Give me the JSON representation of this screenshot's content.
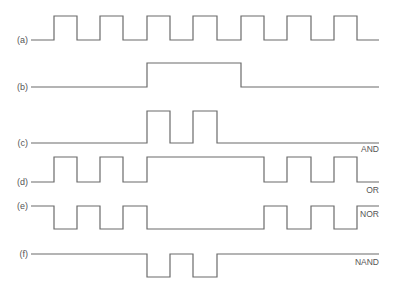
{
  "diagram": {
    "type": "timing-diagram",
    "colors": {
      "line": "#6b6b6b",
      "text": "#555555",
      "background": "#ffffff"
    },
    "x_start": 31,
    "x_end": 379,
    "edges_x": [
      54,
      77,
      100,
      123,
      147,
      170,
      193,
      217,
      241,
      264,
      287,
      311,
      334,
      357
    ],
    "signals": [
      {
        "id": "a",
        "label": "(a)",
        "gate": "",
        "high_y": 16,
        "low_y": 40,
        "label_y": 43,
        "initial": 0,
        "levels": [
          1,
          0,
          1,
          0,
          1,
          0,
          1,
          0,
          1,
          0,
          1,
          0,
          1,
          0
        ]
      },
      {
        "id": "b",
        "label": "(b)",
        "gate": "",
        "high_y": 63,
        "low_y": 87,
        "label_y": 90,
        "initial": 0,
        "levels": [
          0,
          0,
          0,
          0,
          1,
          1,
          1,
          1,
          0,
          0,
          0,
          0,
          0,
          0
        ]
      },
      {
        "id": "c",
        "label": "(c)",
        "gate": "AND",
        "high_y": 111,
        "low_y": 143,
        "label_y": 146,
        "gate_x": 362,
        "gate_y": 152,
        "initial": 0,
        "levels": [
          0,
          0,
          0,
          0,
          1,
          0,
          1,
          0,
          0,
          0,
          0,
          0,
          0,
          0
        ]
      },
      {
        "id": "d",
        "label": "(d)",
        "gate": "OR",
        "high_y": 157,
        "low_y": 182,
        "label_y": 185,
        "gate_x": 368,
        "gate_y": 193,
        "initial": 0,
        "levels": [
          1,
          0,
          1,
          0,
          1,
          1,
          1,
          1,
          1,
          0,
          1,
          0,
          1,
          0
        ]
      },
      {
        "id": "e",
        "label": "(e)",
        "gate": "NOR",
        "high_y": 206,
        "low_y": 229,
        "label_y": 209,
        "gate_x": 361,
        "gate_y": 217,
        "initial": 1,
        "levels": [
          0,
          1,
          0,
          1,
          0,
          0,
          0,
          0,
          0,
          1,
          0,
          1,
          0,
          1
        ]
      },
      {
        "id": "f",
        "label": "(f)",
        "gate": "NAND",
        "high_y": 254,
        "low_y": 277,
        "label_y": 257,
        "gate_x": 355,
        "gate_y": 265,
        "initial": 1,
        "levels": [
          1,
          1,
          1,
          1,
          0,
          1,
          0,
          1,
          1,
          1,
          1,
          1,
          1,
          1
        ]
      }
    ]
  }
}
